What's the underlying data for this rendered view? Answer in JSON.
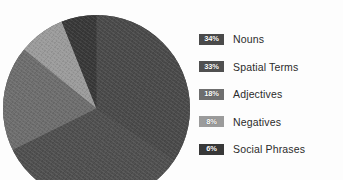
{
  "figure": {
    "caption": "",
    "background": "#fdfdfd"
  },
  "chart_data": {
    "type": "pie",
    "title": "",
    "xlabel": "",
    "ylabel": "",
    "legend_position": "right",
    "grid": false,
    "value_unit": "%",
    "start_angle_deg": 0,
    "direction": "clockwise",
    "categories": [
      "Nouns",
      "Spatial Terms",
      "Adjectives",
      "Negatives",
      "Social Phrases"
    ],
    "values": [
      34,
      33,
      18,
      8,
      6
    ],
    "labels": [
      "34%",
      "33%",
      "18%",
      "8%",
      "6%"
    ],
    "colors": [
      "#4a4a4a",
      "#505050",
      "#6e6e6e",
      "#9b9b9b",
      "#383838"
    ]
  },
  "legend": {
    "items": [
      {
        "percent": "34%",
        "label": "Nouns",
        "color": "#4a4a4a",
        "text_color": "#ffffff"
      },
      {
        "percent": "33%",
        "label": "Spatial Terms",
        "color": "#505050",
        "text_color": "#ffffff"
      },
      {
        "percent": "18%",
        "label": "Adjectives",
        "color": "#6e6e6e",
        "text_color": "#ffffff"
      },
      {
        "percent": "8%",
        "label": "Negatives",
        "color": "#9b9b9b",
        "text_color": "#ffffff"
      },
      {
        "percent": "6%",
        "label": "Social Phrases",
        "color": "#383838",
        "text_color": "#ffffff"
      }
    ]
  }
}
